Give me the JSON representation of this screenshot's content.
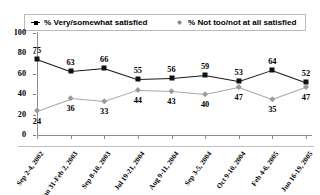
{
  "legend": {
    "position": "top",
    "entries": [
      {
        "label": "% Very/somewhat satisfied",
        "marker": "square-marker",
        "color": "#1a1a1a"
      },
      {
        "label": "% Not too/not at all satisfied",
        "marker": "diamond-marker",
        "color": "#9b9b9b"
      }
    ]
  },
  "chart_data": {
    "type": "line",
    "title": "",
    "subtitle": "",
    "xlabel": "",
    "ylabel": "",
    "ylim": [
      0,
      100
    ],
    "yticks": [
      0,
      20,
      40,
      60,
      80,
      100
    ],
    "grid": false,
    "legend_position": "top",
    "categories": [
      "Sep 2-4, 2002",
      "Jan 31-Feb 2, 2003",
      "Sep 8-10, 2003",
      "Jul 19-21, 2004",
      "Aug 9-11, 2004",
      "Sep 3-5, 2004",
      "Oct 9-10, 2004",
      "Feb 4-6, 2005",
      "Jun 16-19, 2005"
    ],
    "series": [
      {
        "name": "% Very/somewhat satisfied",
        "color": "#1a1a1a",
        "marker": "square",
        "values": [
          75,
          63,
          66,
          55,
          56,
          59,
          53,
          64,
          52
        ]
      },
      {
        "name": "% Not too/not at all satisfied",
        "color": "#9b9b9b",
        "marker": "diamond",
        "values": [
          24,
          36,
          33,
          44,
          43,
          40,
          47,
          35,
          47
        ]
      }
    ]
  }
}
